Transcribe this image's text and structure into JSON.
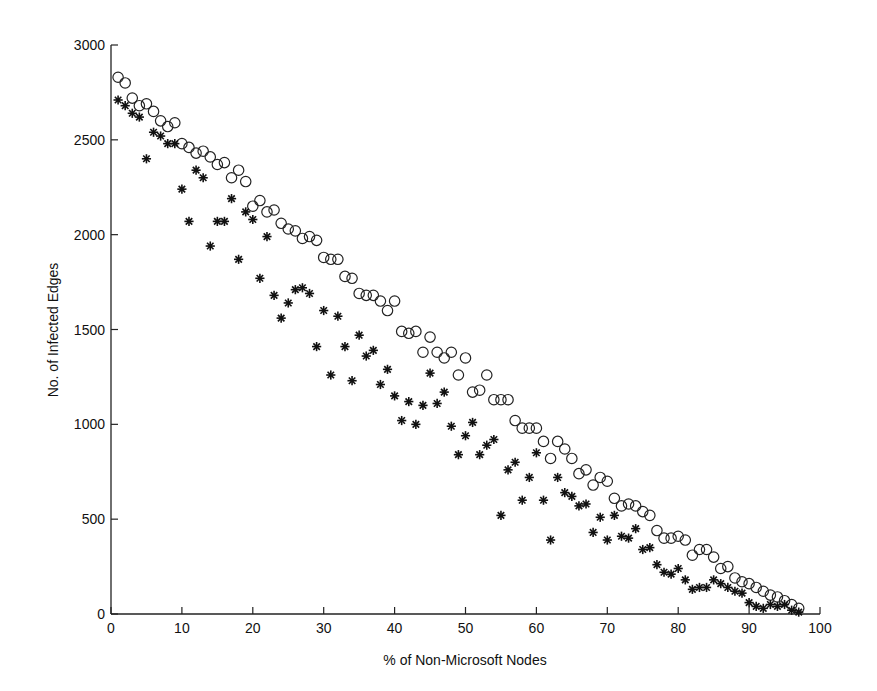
{
  "chart_data": {
    "type": "scatter",
    "title": "",
    "xlabel": "% of Non-Microsoft Nodes",
    "ylabel": "No. of Infected Edges",
    "xlim": [
      0,
      100
    ],
    "ylim": [
      0,
      3000
    ],
    "xticks": [
      0,
      10,
      20,
      30,
      40,
      50,
      60,
      70,
      80,
      90,
      100
    ],
    "yticks": [
      0,
      500,
      1000,
      1500,
      2000,
      2500,
      3000
    ],
    "grid": false,
    "legend": null,
    "series": [
      {
        "name": "circles",
        "marker": "circle-open",
        "color": "#222222",
        "x": [
          1,
          2,
          3,
          4,
          5,
          6,
          7,
          8,
          9,
          10,
          11,
          12,
          13,
          14,
          15,
          16,
          17,
          18,
          19,
          20,
          21,
          22,
          23,
          24,
          25,
          26,
          27,
          28,
          29,
          30,
          31,
          32,
          33,
          34,
          35,
          36,
          37,
          38,
          39,
          40,
          41,
          42,
          43,
          44,
          45,
          46,
          47,
          48,
          49,
          50,
          51,
          52,
          53,
          54,
          55,
          56,
          57,
          58,
          59,
          60,
          61,
          62,
          63,
          64,
          65,
          66,
          67,
          68,
          69,
          70,
          71,
          72,
          73,
          74,
          75,
          76,
          77,
          78,
          79,
          80,
          81,
          82,
          83,
          84,
          85,
          86,
          87,
          88,
          89,
          90,
          91,
          92,
          93,
          94,
          95,
          96,
          97
        ],
        "y": [
          2830,
          2800,
          2720,
          2680,
          2690,
          2650,
          2600,
          2570,
          2590,
          2480,
          2460,
          2430,
          2440,
          2410,
          2370,
          2380,
          2300,
          2340,
          2280,
          2150,
          2180,
          2120,
          2130,
          2060,
          2030,
          2020,
          1980,
          1990,
          1970,
          1880,
          1870,
          1870,
          1780,
          1770,
          1690,
          1680,
          1680,
          1650,
          1600,
          1650,
          1490,
          1480,
          1490,
          1380,
          1460,
          1380,
          1350,
          1380,
          1260,
          1350,
          1170,
          1180,
          1260,
          1130,
          1130,
          1130,
          1020,
          980,
          980,
          980,
          910,
          820,
          910,
          870,
          820,
          740,
          760,
          680,
          720,
          700,
          610,
          570,
          580,
          570,
          540,
          520,
          440,
          400,
          400,
          410,
          390,
          310,
          340,
          340,
          300,
          240,
          250,
          190,
          170,
          160,
          140,
          120,
          100,
          90,
          70,
          50,
          30
        ]
      },
      {
        "name": "stars",
        "marker": "asterisk",
        "color": "#111111",
        "x": [
          1,
          2,
          3,
          4,
          5,
          6,
          7,
          8,
          9,
          10,
          11,
          12,
          13,
          14,
          15,
          16,
          17,
          18,
          19,
          20,
          21,
          22,
          23,
          24,
          25,
          26,
          27,
          28,
          29,
          30,
          31,
          32,
          33,
          34,
          35,
          36,
          37,
          38,
          39,
          40,
          41,
          42,
          43,
          44,
          45,
          46,
          47,
          48,
          49,
          50,
          51,
          52,
          53,
          54,
          55,
          56,
          57,
          58,
          59,
          60,
          61,
          62,
          63,
          64,
          65,
          66,
          67,
          68,
          69,
          70,
          71,
          72,
          73,
          74,
          75,
          76,
          77,
          78,
          79,
          80,
          81,
          82,
          83,
          84,
          85,
          86,
          87,
          88,
          89,
          90,
          91,
          92,
          93,
          94,
          95,
          96,
          97
        ],
        "y": [
          2710,
          2680,
          2640,
          2620,
          2400,
          2540,
          2520,
          2480,
          2480,
          2240,
          2070,
          2340,
          2300,
          1940,
          2070,
          2070,
          2190,
          1870,
          2120,
          2080,
          1770,
          1990,
          1680,
          1560,
          1640,
          1710,
          1720,
          1690,
          1410,
          1600,
          1260,
          1570,
          1410,
          1230,
          1470,
          1360,
          1390,
          1210,
          1290,
          1150,
          1020,
          1120,
          1000,
          1100,
          1270,
          1110,
          1170,
          990,
          840,
          940,
          1010,
          840,
          890,
          920,
          520,
          760,
          800,
          600,
          720,
          850,
          600,
          390,
          720,
          640,
          620,
          570,
          580,
          430,
          510,
          390,
          520,
          410,
          400,
          450,
          340,
          350,
          260,
          220,
          210,
          240,
          180,
          130,
          140,
          140,
          180,
          160,
          140,
          120,
          110,
          60,
          40,
          30,
          50,
          40,
          50,
          20,
          10
        ]
      }
    ]
  }
}
